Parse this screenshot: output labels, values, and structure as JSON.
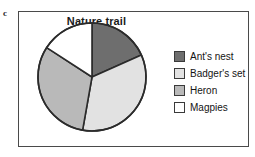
{
  "figure": {
    "letter": "c"
  },
  "chart_data": {
    "type": "pie",
    "title": "Nature trail",
    "xlabel": "",
    "ylabel": "",
    "legend_position": "right",
    "grid": false,
    "categories": [
      "Ant's nest",
      "Badger's set",
      "Heron",
      "Magpies"
    ],
    "values": [
      18,
      34,
      32,
      16
    ],
    "unit": "percent",
    "start_angle_deg": 0,
    "direction": "clockwise",
    "slices": [
      {
        "label": "Ant's nest",
        "value": 18,
        "start_deg": 0,
        "end_deg": 66,
        "color": "#6e6e6e"
      },
      {
        "label": "Badger's set",
        "value": 34,
        "start_deg": 66,
        "end_deg": 190,
        "color": "#e2e2e2"
      },
      {
        "label": "Heron",
        "value": 32,
        "start_deg": 190,
        "end_deg": 303,
        "color": "#b9b9b9"
      },
      {
        "label": "Magpies",
        "value": 16,
        "start_deg": 303,
        "end_deg": 360,
        "color": "#ffffff"
      }
    ],
    "stroke_color": "#2b2b2b"
  },
  "legend": {
    "items": [
      {
        "label": "Ant's nest",
        "color": "#6e6e6e"
      },
      {
        "label": "Badger's set",
        "color": "#e2e2e2"
      },
      {
        "label": "Heron",
        "color": "#b9b9b9"
      },
      {
        "label": "Magpies",
        "color": "#ffffff"
      }
    ]
  }
}
